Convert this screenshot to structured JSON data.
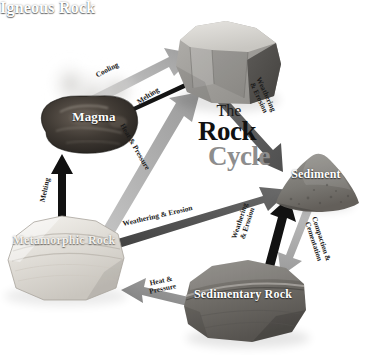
{
  "diagram": {
    "title": {
      "line1": "The",
      "line2": "Rock",
      "line3": "Cycle"
    },
    "nodes": [
      {
        "id": "igneous",
        "label": "Igneous Rock",
        "shape": "angular-boulder",
        "color": "#9b9b9b"
      },
      {
        "id": "magma",
        "label": "Magma",
        "shape": "molten-blob",
        "color": "#3a3632"
      },
      {
        "id": "sediment",
        "label": "Sediment",
        "shape": "granular-mound",
        "color": "#7c7a76"
      },
      {
        "id": "metamorphic",
        "label": "Metamorphic Rock",
        "shape": "banded-boulder",
        "color": "#e9e7e2"
      },
      {
        "id": "sedimentary",
        "label": "Sedimentary Rock",
        "shape": "layered-boulder",
        "color": "#6e6c69"
      }
    ],
    "arrows": [
      {
        "id": "magma-to-igneous",
        "label": "Cooling",
        "from": "magma",
        "to": "igneous",
        "color": "#b4b4b4"
      },
      {
        "id": "igneous-to-magma",
        "label": "Melting",
        "from": "igneous",
        "to": "magma",
        "color": "#1a1a1a"
      },
      {
        "id": "igneous-to-sediment",
        "label": "Weathering & Erosion",
        "from": "igneous",
        "to": "sediment",
        "color": "#5e5e5e"
      },
      {
        "id": "metamorphic-to-igneous",
        "label": "Heat & Pressure",
        "from": "metamorphic",
        "to": "igneous",
        "color": "#b0b0b0"
      },
      {
        "id": "metamorphic-to-magma",
        "label": "Melting",
        "from": "metamorphic",
        "to": "magma",
        "color": "#111111"
      },
      {
        "id": "metamorphic-to-sediment",
        "label": "Weathering & Erosion",
        "from": "metamorphic",
        "to": "sediment",
        "color": "#4a4a4a"
      },
      {
        "id": "sedimentary-to-sediment",
        "label": "Weathering & Erosion",
        "from": "sedimentary",
        "to": "sediment",
        "color": "#121212"
      },
      {
        "id": "sediment-to-sedimentary",
        "label": "Compaction & Cementation",
        "from": "sediment",
        "to": "sedimentary",
        "color": "#aeaeae"
      },
      {
        "id": "sedimentary-to-metamorphic",
        "label": "Heat & Pressure",
        "from": "sedimentary",
        "to": "metamorphic",
        "color": "#8f8f8f"
      }
    ],
    "arrow_label_lines": {
      "weathering_erosion_l1": "Weathering",
      "weathering_erosion_l2": "& Erosion",
      "heat_pressure_l1": "Heat &",
      "heat_pressure_l2": "Pressure",
      "compaction_l1": "Compaction &",
      "compaction_l2": "Cementation"
    }
  }
}
